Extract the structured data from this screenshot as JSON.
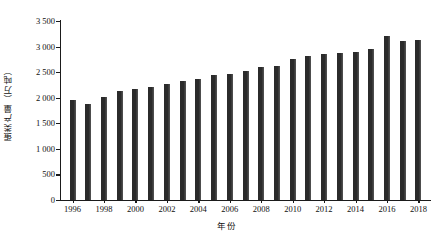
{
  "chart_data": {
    "type": "bar",
    "title": "",
    "subtitle": "",
    "xlabel": "年份",
    "ylabel": "蛋类产量（万吨）",
    "categories": [
      "1996",
      "1997",
      "1998",
      "1999",
      "2000",
      "2001",
      "2002",
      "2003",
      "2004",
      "2005",
      "2006",
      "2007",
      "2008",
      "2009",
      "2010",
      "2011",
      "2012",
      "2013",
      "2014",
      "2015",
      "2016",
      "2017",
      "2018"
    ],
    "values": [
      1965,
      1880,
      2020,
      2140,
      2180,
      2210,
      2270,
      2330,
      2370,
      2440,
      2460,
      2530,
      2600,
      2620,
      2760,
      2810,
      2860,
      2880,
      2900,
      2960,
      3200,
      3100,
      3130
    ],
    "ytick_labels": [
      "0",
      "500",
      "1 000",
      "1 500",
      "2 000",
      "2 500",
      "3 000",
      "3 500"
    ],
    "ytick_values": [
      0,
      500,
      1000,
      1500,
      2000,
      2500,
      3000,
      3500
    ],
    "xtick_labels": [
      "1996",
      "1998",
      "2000",
      "2002",
      "2004",
      "2006",
      "2008",
      "2010",
      "2012",
      "2014",
      "2016",
      "2018"
    ],
    "xtick_values": [
      1996,
      1998,
      2000,
      2002,
      2004,
      2006,
      2008,
      2010,
      2012,
      2014,
      2016,
      2018
    ],
    "ylim": [
      0,
      3500
    ],
    "grid": false,
    "legend": null,
    "bar_color": "#2b2b2b",
    "axis_color": "#1b1b1b",
    "background": "#ffffff"
  }
}
